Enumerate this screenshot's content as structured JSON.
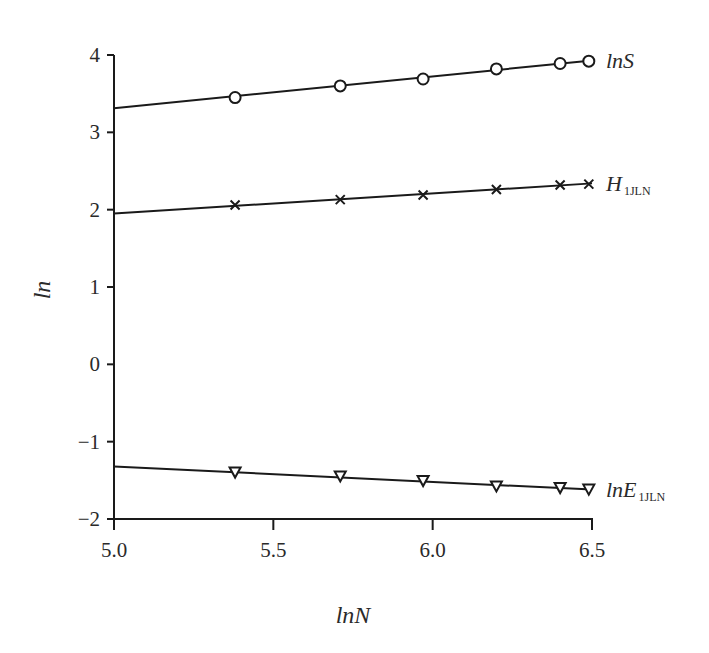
{
  "chart_data": {
    "type": "line",
    "title": "",
    "xlabel": "lnN",
    "ylabel": "ln",
    "xlim": [
      5.0,
      6.5
    ],
    "ylim": [
      -2,
      4
    ],
    "x_ticks": [
      "5.0",
      "5.5",
      "6.0",
      "6.5"
    ],
    "y_ticks": [
      "4",
      "3",
      "2",
      "1",
      "0",
      "−1",
      "−2"
    ],
    "grid": false,
    "legend": "inline labels at right end of each line",
    "x": [
      5.38,
      5.71,
      5.97,
      6.2,
      6.4,
      6.49
    ],
    "series": [
      {
        "name": "lnS",
        "label_main": "lnS",
        "label_sub": "",
        "marker": "circle",
        "values": [
          3.45,
          3.6,
          3.69,
          3.82,
          3.89,
          3.92
        ],
        "fit_line": {
          "x": [
            5.0,
            6.5
          ],
          "y": [
            3.31,
            3.93
          ]
        }
      },
      {
        "name": "H_1JLN",
        "label_main": "H",
        "label_sub": "1JLN",
        "marker": "x",
        "values": [
          2.06,
          2.13,
          2.19,
          2.26,
          2.32,
          2.33
        ],
        "fit_line": {
          "x": [
            5.0,
            6.5
          ],
          "y": [
            1.95,
            2.34
          ]
        }
      },
      {
        "name": "lnE_1JLN",
        "label_main": "lnE",
        "label_sub": "1JLN",
        "marker": "triangle-down",
        "values": [
          -1.4,
          -1.45,
          -1.51,
          -1.58,
          -1.6,
          -1.62
        ],
        "fit_line": {
          "x": [
            5.0,
            6.5
          ],
          "y": [
            -1.32,
            -1.62
          ]
        }
      }
    ]
  }
}
